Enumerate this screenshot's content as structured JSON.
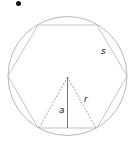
{
  "diagram": {
    "shapes": {
      "circle": "circumscribed circle",
      "polygon": "regular hexagon",
      "polygon_sides": 6
    },
    "labels": {
      "side": "s",
      "radius": "r",
      "apothem": "a"
    },
    "bullet": "•",
    "colors": {
      "stroke": "#b8b8b8",
      "dashed": "#8a8a8a",
      "apothem": "#555555",
      "text": "#222222",
      "bullet": "#111111"
    }
  }
}
